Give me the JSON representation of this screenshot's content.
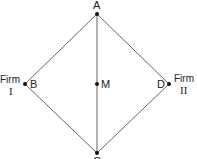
{
  "diagram": {
    "nodes": {
      "A": {
        "label": "A",
        "x": 97,
        "y": 14
      },
      "B": {
        "label": "B",
        "x": 25,
        "y": 84
      },
      "M": {
        "label": "M",
        "x": 97,
        "y": 84
      },
      "D": {
        "label": "D",
        "x": 169,
        "y": 84
      },
      "C": {
        "label": "C",
        "x": 97,
        "y": 153
      }
    },
    "firm_left": {
      "word": "Firm",
      "numeral": "I"
    },
    "firm_right": {
      "word": "Firm",
      "numeral": "II"
    },
    "edges": [
      [
        "A",
        "B"
      ],
      [
        "B",
        "C"
      ],
      [
        "C",
        "D"
      ],
      [
        "D",
        "A"
      ],
      [
        "A",
        "C"
      ]
    ],
    "colors": {
      "line": "#555555",
      "dot": "#111111",
      "text": "#222222"
    }
  }
}
